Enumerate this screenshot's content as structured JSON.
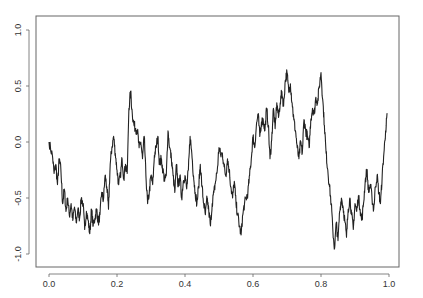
{
  "chart_data": {
    "type": "line",
    "title": "",
    "xlabel": "",
    "ylabel": "",
    "xlim": [
      -0.04,
      1.03
    ],
    "ylim": [
      -1.11,
      1.12
    ],
    "grid": false,
    "legend": null,
    "x_ticks": [
      0.0,
      0.2,
      0.4,
      0.6,
      0.8,
      1.0
    ],
    "x_tick_labels": [
      "0.0",
      "0.2",
      "0.4",
      "0.6",
      "0.8",
      "1.0"
    ],
    "y_ticks": [
      -1.0,
      -0.5,
      0.0,
      0.5,
      1.0
    ],
    "y_tick_labels": [
      "-1.0",
      "-0.5",
      "0.0",
      "0.5",
      "1.0"
    ],
    "line_color": "#222222",
    "series": [
      {
        "name": "path",
        "x": [
          0.0,
          0.01,
          0.015,
          0.02,
          0.025,
          0.03,
          0.035,
          0.04,
          0.045,
          0.05,
          0.055,
          0.06,
          0.065,
          0.07,
          0.075,
          0.08,
          0.085,
          0.09,
          0.095,
          0.1,
          0.105,
          0.11,
          0.115,
          0.12,
          0.125,
          0.13,
          0.135,
          0.14,
          0.145,
          0.15,
          0.155,
          0.16,
          0.165,
          0.17,
          0.175,
          0.18,
          0.185,
          0.19,
          0.195,
          0.2,
          0.205,
          0.21,
          0.215,
          0.22,
          0.225,
          0.23,
          0.235,
          0.24,
          0.245,
          0.25,
          0.255,
          0.26,
          0.265,
          0.27,
          0.275,
          0.28,
          0.285,
          0.29,
          0.295,
          0.3,
          0.305,
          0.31,
          0.315,
          0.32,
          0.325,
          0.33,
          0.335,
          0.34,
          0.345,
          0.35,
          0.355,
          0.36,
          0.365,
          0.37,
          0.375,
          0.38,
          0.385,
          0.39,
          0.395,
          0.4,
          0.405,
          0.41,
          0.415,
          0.42,
          0.425,
          0.43,
          0.435,
          0.44,
          0.445,
          0.45,
          0.455,
          0.46,
          0.465,
          0.47,
          0.475,
          0.48,
          0.485,
          0.49,
          0.495,
          0.5,
          0.505,
          0.51,
          0.515,
          0.52,
          0.525,
          0.53,
          0.535,
          0.54,
          0.545,
          0.55,
          0.555,
          0.56,
          0.565,
          0.57,
          0.575,
          0.58,
          0.585,
          0.59,
          0.595,
          0.6,
          0.605,
          0.61,
          0.615,
          0.62,
          0.625,
          0.63,
          0.635,
          0.64,
          0.645,
          0.65,
          0.655,
          0.66,
          0.665,
          0.67,
          0.675,
          0.68,
          0.685,
          0.69,
          0.695,
          0.7,
          0.705,
          0.71,
          0.715,
          0.72,
          0.725,
          0.73,
          0.735,
          0.74,
          0.745,
          0.75,
          0.755,
          0.76,
          0.765,
          0.77,
          0.775,
          0.78,
          0.785,
          0.79,
          0.795,
          0.8,
          0.805,
          0.81,
          0.815,
          0.82,
          0.825,
          0.83,
          0.835,
          0.84,
          0.845,
          0.85,
          0.855,
          0.86,
          0.865,
          0.87,
          0.875,
          0.88,
          0.885,
          0.89,
          0.895,
          0.9,
          0.905,
          0.91,
          0.915,
          0.92,
          0.925,
          0.93,
          0.935,
          0.94,
          0.945,
          0.95,
          0.955,
          0.96,
          0.965,
          0.97,
          0.975,
          0.98,
          0.985,
          0.99,
          0.995
        ],
        "y": [
          0.0,
          -0.12,
          -0.28,
          -0.2,
          -0.38,
          -0.15,
          -0.25,
          -0.55,
          -0.42,
          -0.62,
          -0.5,
          -0.66,
          -0.55,
          -0.7,
          -0.58,
          -0.72,
          -0.6,
          -0.68,
          -0.5,
          -0.55,
          -0.78,
          -0.62,
          -0.7,
          -0.82,
          -0.6,
          -0.75,
          -0.68,
          -0.6,
          -0.72,
          -0.65,
          -0.45,
          -0.52,
          -0.3,
          -0.4,
          -0.6,
          -0.2,
          -0.05,
          0.05,
          -0.1,
          -0.25,
          -0.38,
          -0.3,
          -0.15,
          -0.32,
          -0.2,
          -0.28,
          0.3,
          0.45,
          0.25,
          0.15,
          0.12,
          0.1,
          -0.05,
          0.0,
          -0.15,
          0.05,
          -0.3,
          -0.55,
          -0.45,
          -0.3,
          -0.38,
          -0.12,
          -0.05,
          0.05,
          -0.2,
          -0.15,
          -0.25,
          -0.35,
          -0.3,
          0.1,
          -0.05,
          -0.15,
          -0.3,
          -0.45,
          -0.2,
          -0.4,
          -0.3,
          -0.5,
          -0.35,
          -0.3,
          -0.42,
          -0.25,
          0.05,
          -0.1,
          -0.3,
          -0.45,
          -0.55,
          -0.4,
          -0.2,
          -0.4,
          -0.55,
          -0.65,
          -0.5,
          -0.62,
          -0.75,
          -0.55,
          -0.45,
          -0.35,
          -0.25,
          -0.05,
          -0.12,
          -0.1,
          -0.22,
          -0.3,
          -0.15,
          -0.25,
          -0.4,
          -0.5,
          -0.35,
          -0.55,
          -0.65,
          -0.75,
          -0.83,
          -0.65,
          -0.55,
          -0.5,
          -0.45,
          -0.3,
          -0.15,
          0.05,
          -0.05,
          0.15,
          0.25,
          0.05,
          0.18,
          0.2,
          0.1,
          0.3,
          0.15,
          -0.15,
          0.02,
          0.3,
          0.12,
          0.35,
          0.22,
          0.35,
          0.45,
          0.32,
          0.55,
          0.62,
          0.45,
          0.52,
          0.35,
          0.2,
          0.1,
          -0.05,
          -0.15,
          0.0,
          -0.1,
          0.2,
          0.1,
          0.05,
          -0.05,
          0.2,
          0.3,
          0.25,
          0.4,
          0.35,
          0.5,
          0.62,
          0.38,
          0.15,
          -0.1,
          -0.25,
          -0.4,
          -0.55,
          -0.8,
          -0.95,
          -0.72,
          -0.88,
          -0.62,
          -0.5,
          -0.58,
          -0.7,
          -0.85,
          -0.6,
          -0.5,
          -0.65,
          -0.78,
          -0.55,
          -0.62,
          -0.48,
          -0.6,
          -0.7,
          -0.55,
          -0.35,
          -0.25,
          -0.45,
          -0.38,
          -0.5,
          -0.6,
          -0.4,
          -0.3,
          -0.45,
          -0.55,
          -0.3,
          -0.1,
          0.1,
          0.25
        ]
      }
    ]
  }
}
